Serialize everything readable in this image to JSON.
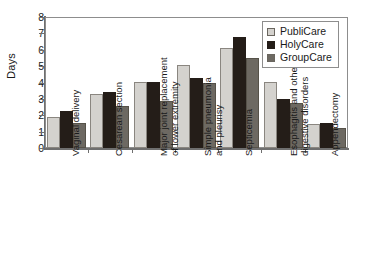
{
  "chart_data": {
    "type": "bar",
    "title": "",
    "xlabel": "",
    "ylabel": "Days",
    "ylim": [
      0,
      8
    ],
    "yticks": [
      0,
      1,
      2,
      3,
      4,
      5,
      6,
      7,
      8
    ],
    "grid": false,
    "legend_position": "top-right",
    "categories": [
      "Vaginal delivery",
      "Cesarean section",
      "Major joint replacement\nof lower extremity",
      "Simple pneumonia\nand pleurisy",
      "Septicemia",
      "Esophagitis and other\ndigestive disorders",
      "Appendectomy"
    ],
    "series": [
      {
        "name": "PubliCare",
        "color": "#d4d2ce",
        "values": [
          1.9,
          3.3,
          4.05,
          5.05,
          6.1,
          4.05,
          1.45
        ]
      },
      {
        "name": "HolyCare",
        "color": "#241d18",
        "values": [
          2.25,
          3.4,
          4.05,
          4.25,
          6.8,
          3.0,
          1.55
        ]
      },
      {
        "name": "GroupCare",
        "color": "#6d6962",
        "values": [
          1.5,
          2.55,
          2.9,
          3.95,
          5.5,
          2.75,
          1.25
        ]
      }
    ]
  }
}
